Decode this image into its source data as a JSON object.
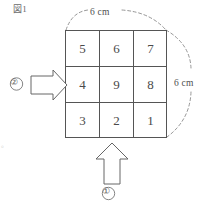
{
  "figure": {
    "caption": "図1",
    "unit_note": "cm"
  },
  "dimensions": {
    "top": {
      "label": "6 cm",
      "value": 6,
      "unit": "cm",
      "side": "top"
    },
    "right": {
      "label": "6 cm",
      "value": 6,
      "unit": "cm",
      "side": "right"
    }
  },
  "grid": {
    "rows": 3,
    "columns": 3,
    "cells": [
      [
        "5",
        "6",
        "7"
      ],
      [
        "4",
        "9",
        "8"
      ],
      [
        "3",
        "2",
        "1"
      ]
    ]
  },
  "markers": {
    "bottom": {
      "label": "①",
      "direction": "up",
      "icon": "arrow-up-icon"
    },
    "left": {
      "label": "②",
      "direction": "right",
      "icon": "arrow-right-icon"
    }
  },
  "artifacts": {
    "stray_punctuation": "。"
  },
  "colors": {
    "line": "#555555",
    "text": "#4a4a4a",
    "dashed": "#808080",
    "background": "#ffffff"
  }
}
